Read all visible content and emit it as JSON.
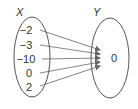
{
  "diagram": {
    "type": "mapping",
    "domain_set": {
      "label": "X",
      "elements": [
        "−2",
        "−3",
        "−10",
        "0",
        "2"
      ]
    },
    "codomain_set": {
      "label": "Y",
      "elements": [
        "0"
      ]
    },
    "mappings": [
      {
        "from": "−2",
        "to": "0"
      },
      {
        "from": "−3",
        "to": "0"
      },
      {
        "from": "−10",
        "to": "0"
      },
      {
        "from": "0",
        "to": "0"
      },
      {
        "from": "2",
        "to": "0"
      }
    ],
    "colors": {
      "stroke": "#555555",
      "arrow": "#666666",
      "text": "#333333"
    }
  }
}
